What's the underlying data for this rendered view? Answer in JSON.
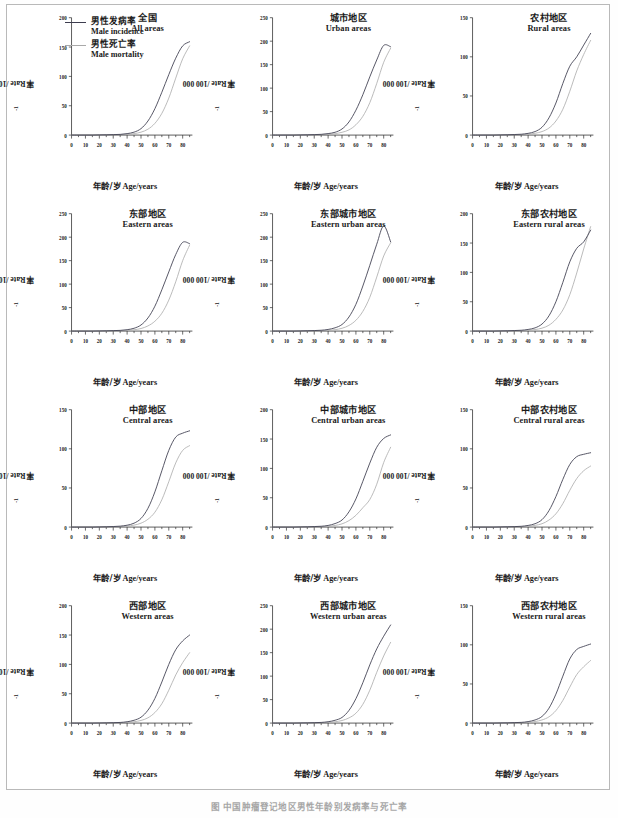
{
  "figure": {
    "axis_x_label_cn": "年龄/岁",
    "axis_x_label_en": "Age/years",
    "axis_y_label": "率Rate /100 000",
    "axis_y_label_sup": "-1",
    "caption": "图 中国肿瘤登记地区男性年龄别发病率与死亡率"
  },
  "legend": {
    "incidence": {
      "cn": "男性发病率",
      "en": "Male incidence",
      "color": "#3d3d4f"
    },
    "mortality": {
      "cn": "男性死亡率",
      "en": "Male mortality",
      "color": "#a9a9a9"
    }
  },
  "colors": {
    "incidence": "#3d3d4f",
    "mortality": "#a9a9a9",
    "axis": "#2b2b2b",
    "frame": "#b9b9b9"
  },
  "chart_data": [
    {
      "type": "line",
      "title_cn": "全国",
      "title_en": "All areas",
      "xlabel": "年龄/岁 Age/years",
      "ylabel": "率Rate /100 000-1",
      "xlim": [
        0,
        87
      ],
      "ylim": [
        0,
        200
      ],
      "xticks": [
        0,
        10,
        20,
        30,
        40,
        50,
        60,
        70,
        80
      ],
      "yticks": [
        0,
        50,
        100,
        150,
        200
      ],
      "grid": false,
      "x": [
        0,
        5,
        10,
        15,
        20,
        25,
        30,
        35,
        40,
        45,
        50,
        55,
        60,
        65,
        70,
        75,
        80,
        85
      ],
      "series": [
        {
          "name": "Male incidence",
          "values": [
            0,
            0,
            0,
            0,
            0.3,
            0.5,
            0.8,
            1.2,
            2.5,
            5,
            11,
            24,
            45,
            73,
            103,
            131,
            152,
            159
          ]
        },
        {
          "name": "Male mortality",
          "values": [
            0,
            0,
            0,
            0,
            0.2,
            0.3,
            0.4,
            0.7,
            1.3,
            2.5,
            5,
            10,
            20,
            37,
            63,
            97,
            130,
            152
          ]
        }
      ]
    },
    {
      "type": "line",
      "title_cn": "城市地区",
      "title_en": "Urban areas",
      "xlabel": "年龄/岁 Age/years",
      "ylabel": "率Rate /100 000-1",
      "xlim": [
        0,
        87
      ],
      "ylim": [
        0,
        250
      ],
      "xticks": [
        0,
        10,
        20,
        30,
        40,
        50,
        60,
        70,
        80
      ],
      "yticks": [
        0,
        50,
        100,
        150,
        200,
        250
      ],
      "grid": false,
      "x": [
        0,
        5,
        10,
        15,
        20,
        25,
        30,
        35,
        40,
        45,
        50,
        55,
        60,
        65,
        70,
        75,
        80,
        85
      ],
      "series": [
        {
          "name": "Male incidence",
          "values": [
            0,
            0,
            0,
            0,
            0.3,
            0.6,
            1.0,
            1.6,
            3.2,
            6,
            13,
            28,
            53,
            86,
            124,
            160,
            191,
            188
          ]
        },
        {
          "name": "Male mortality",
          "values": [
            0,
            0,
            0,
            0,
            0.2,
            0.3,
            0.5,
            0.8,
            1.5,
            3,
            6,
            11,
            22,
            40,
            69,
            110,
            155,
            185
          ]
        }
      ]
    },
    {
      "type": "line",
      "title_cn": "农村地区",
      "title_en": "Rural areas",
      "xlabel": "年龄/岁 Age/years",
      "ylabel": "率Rate /100 000-1",
      "xlim": [
        0,
        87
      ],
      "ylim": [
        0,
        150
      ],
      "xticks": [
        0,
        10,
        20,
        30,
        40,
        50,
        60,
        70,
        80
      ],
      "yticks": [
        0,
        50,
        100,
        150
      ],
      "grid": false,
      "x": [
        0,
        5,
        10,
        15,
        20,
        25,
        30,
        35,
        40,
        45,
        50,
        55,
        60,
        65,
        70,
        75,
        80,
        85
      ],
      "series": [
        {
          "name": "Male incidence",
          "values": [
            0,
            0,
            0,
            0,
            0.2,
            0.4,
            0.7,
            1.1,
            2.2,
            4.5,
            10,
            22,
            41,
            66,
            88,
            100,
            115,
            130
          ]
        },
        {
          "name": "Male mortality",
          "values": [
            0,
            0,
            0,
            0,
            0.2,
            0.3,
            0.4,
            0.6,
            1.2,
            2.3,
            4.5,
            9,
            18,
            33,
            56,
            82,
            103,
            121
          ]
        }
      ]
    },
    {
      "type": "line",
      "title_cn": "东部地区",
      "title_en": "Eastern areas",
      "xlabel": "年龄/岁 Age/years",
      "ylabel": "率Rate /100 000-1",
      "xlim": [
        0,
        87
      ],
      "ylim": [
        0,
        250
      ],
      "xticks": [
        0,
        10,
        20,
        30,
        40,
        50,
        60,
        70,
        80
      ],
      "yticks": [
        0,
        50,
        100,
        150,
        200,
        250
      ],
      "grid": false,
      "x": [
        0,
        5,
        10,
        15,
        20,
        25,
        30,
        35,
        40,
        45,
        50,
        55,
        60,
        65,
        70,
        75,
        80,
        85
      ],
      "series": [
        {
          "name": "Male incidence",
          "values": [
            0,
            0,
            0,
            0,
            0.3,
            0.6,
            1.0,
            1.5,
            3.0,
            6,
            13,
            28,
            53,
            88,
            126,
            163,
            189,
            186
          ]
        },
        {
          "name": "Male mortality",
          "values": [
            0,
            0,
            0,
            0,
            0.2,
            0.3,
            0.5,
            0.8,
            1.5,
            2.8,
            5.5,
            11,
            21,
            38,
            66,
            105,
            150,
            183
          ]
        }
      ]
    },
    {
      "type": "line",
      "title_cn": "东部城市地区",
      "title_en": "Eastern urban areas",
      "xlabel": "年龄/岁 Age/years",
      "ylabel": "率Rate /100 000-1",
      "xlim": [
        0,
        87
      ],
      "ylim": [
        0,
        250
      ],
      "xticks": [
        0,
        10,
        20,
        30,
        40,
        50,
        60,
        70,
        80
      ],
      "yticks": [
        0,
        50,
        100,
        150,
        200,
        250
      ],
      "grid": false,
      "x": [
        0,
        5,
        10,
        15,
        20,
        25,
        30,
        35,
        40,
        45,
        50,
        55,
        60,
        65,
        70,
        75,
        80,
        85
      ],
      "series": [
        {
          "name": "Male incidence",
          "values": [
            0,
            0,
            0,
            0,
            0.3,
            0.7,
            1.1,
            1.8,
            3.5,
            7,
            14,
            30,
            57,
            96,
            140,
            185,
            224,
            190
          ]
        },
        {
          "name": "Male mortality",
          "values": [
            0,
            0,
            0,
            0,
            0.2,
            0.3,
            0.5,
            0.9,
            1.6,
            3,
            6,
            12,
            23,
            42,
            72,
            115,
            160,
            188
          ]
        }
      ]
    },
    {
      "type": "line",
      "title_cn": "东部农村地区",
      "title_en": "Eastern rural areas",
      "xlabel": "年龄/岁 Age/years",
      "ylabel": "率Rate /100 000-1",
      "xlim": [
        0,
        87
      ],
      "ylim": [
        0,
        200
      ],
      "xticks": [
        0,
        10,
        20,
        30,
        40,
        50,
        60,
        70,
        80
      ],
      "yticks": [
        0,
        50,
        100,
        150,
        200
      ],
      "grid": false,
      "x": [
        0,
        5,
        10,
        15,
        20,
        25,
        30,
        35,
        40,
        45,
        50,
        55,
        60,
        65,
        70,
        75,
        80,
        85
      ],
      "series": [
        {
          "name": "Male incidence",
          "values": [
            0,
            0,
            0,
            0,
            0.3,
            0.5,
            0.9,
            1.4,
            2.8,
            5.5,
            12,
            26,
            50,
            83,
            118,
            141,
            152,
            172
          ]
        },
        {
          "name": "Male mortality",
          "values": [
            0,
            0,
            0,
            0,
            0.2,
            0.3,
            0.4,
            0.7,
            1.3,
            2.6,
            5,
            10,
            20,
            36,
            62,
            99,
            140,
            178
          ]
        }
      ]
    },
    {
      "type": "line",
      "title_cn": "中部地区",
      "title_en": "Central areas",
      "xlabel": "年龄/岁 Age/years",
      "ylabel": "率Rate /100 000-1",
      "xlim": [
        0,
        87
      ],
      "ylim": [
        0,
        150
      ],
      "xticks": [
        0,
        10,
        20,
        30,
        40,
        50,
        60,
        70,
        80
      ],
      "yticks": [
        0,
        50,
        100,
        150
      ],
      "grid": false,
      "x": [
        0,
        5,
        10,
        15,
        20,
        25,
        30,
        35,
        40,
        45,
        50,
        55,
        60,
        65,
        70,
        75,
        80,
        85
      ],
      "series": [
        {
          "name": "Male incidence",
          "values": [
            0,
            0,
            0,
            0,
            0.2,
            0.4,
            0.7,
            1.2,
            2.4,
            5,
            11,
            24,
            45,
            72,
            98,
            115,
            120,
            123
          ]
        },
        {
          "name": "Male mortality",
          "values": [
            0,
            0,
            0,
            0,
            0.2,
            0.3,
            0.4,
            0.7,
            1.3,
            2.5,
            5,
            10,
            19,
            35,
            58,
            82,
            98,
            104
          ]
        }
      ]
    },
    {
      "type": "line",
      "title_cn": "中部城市地区",
      "title_en": "Central urban areas",
      "xlabel": "年龄/岁 Age/years",
      "ylabel": "率Rate /100 000-1",
      "xlim": [
        0,
        87
      ],
      "ylim": [
        0,
        200
      ],
      "xticks": [
        0,
        10,
        20,
        30,
        40,
        50,
        60,
        70,
        80
      ],
      "yticks": [
        0,
        50,
        100,
        150,
        200
      ],
      "grid": false,
      "x": [
        0,
        5,
        10,
        15,
        20,
        25,
        30,
        35,
        40,
        45,
        50,
        55,
        60,
        65,
        70,
        75,
        80,
        85
      ],
      "series": [
        {
          "name": "Male incidence",
          "values": [
            0,
            0,
            0,
            0,
            0.3,
            0.5,
            0.9,
            1.4,
            2.8,
            6,
            12,
            26,
            48,
            78,
            109,
            136,
            151,
            157
          ]
        },
        {
          "name": "Male mortality",
          "values": [
            0,
            0,
            0,
            0,
            0.2,
            0.3,
            0.5,
            0.8,
            1.4,
            2.8,
            5.5,
            11,
            20,
            33,
            47,
            73,
            110,
            136
          ]
        }
      ]
    },
    {
      "type": "line",
      "title_cn": "中部农村地区",
      "title_en": "Central rural areas",
      "xlabel": "年龄/岁 Age/years",
      "ylabel": "率Rate /100 000-1",
      "xlim": [
        0,
        87
      ],
      "ylim": [
        0,
        150
      ],
      "xticks": [
        0,
        10,
        20,
        30,
        40,
        50,
        60,
        70,
        80
      ],
      "yticks": [
        0,
        50,
        100,
        150
      ],
      "grid": false,
      "x": [
        0,
        5,
        10,
        15,
        20,
        25,
        30,
        35,
        40,
        45,
        50,
        55,
        60,
        65,
        70,
        75,
        80,
        85
      ],
      "series": [
        {
          "name": "Male incidence",
          "values": [
            0,
            0,
            0,
            0,
            0.2,
            0.4,
            0.6,
            1.0,
            2.1,
            4.3,
            9.5,
            21,
            39,
            61,
            80,
            90,
            93,
            95
          ]
        },
        {
          "name": "Male mortality",
          "values": [
            0,
            0,
            0,
            0,
            0.2,
            0.3,
            0.4,
            0.6,
            1.1,
            2.2,
            4.3,
            9,
            17,
            30,
            47,
            62,
            72,
            78
          ]
        }
      ]
    },
    {
      "type": "line",
      "title_cn": "西部地区",
      "title_en": "Western areas",
      "xlabel": "年龄/岁 Age/years",
      "ylabel": "率Rate /100 000-1",
      "xlim": [
        0,
        87
      ],
      "ylim": [
        0,
        200
      ],
      "xticks": [
        0,
        10,
        20,
        30,
        40,
        50,
        60,
        70,
        80
      ],
      "yticks": [
        0,
        50,
        100,
        150,
        200
      ],
      "grid": false,
      "x": [
        0,
        5,
        10,
        15,
        20,
        25,
        30,
        35,
        40,
        45,
        50,
        55,
        60,
        65,
        70,
        75,
        80,
        85
      ],
      "series": [
        {
          "name": "Male incidence",
          "values": [
            0,
            0,
            0,
            0,
            0.2,
            0.4,
            0.7,
            1.1,
            2.3,
            4.8,
            10,
            22,
            42,
            70,
            100,
            125,
            140,
            150
          ]
        },
        {
          "name": "Male mortality",
          "values": [
            0,
            0,
            0,
            0,
            0.2,
            0.3,
            0.4,
            0.6,
            1.2,
            2.3,
            4.5,
            9,
            18,
            33,
            56,
            82,
            103,
            120
          ]
        }
      ]
    },
    {
      "type": "line",
      "title_cn": "西部城市地区",
      "title_en": "Western urban areas",
      "xlabel": "年龄/岁 Age/years",
      "ylabel": "率Rate /100 000-1",
      "xlim": [
        0,
        87
      ],
      "ylim": [
        0,
        250
      ],
      "xticks": [
        0,
        10,
        20,
        30,
        40,
        50,
        60,
        70,
        80
      ],
      "yticks": [
        0,
        50,
        100,
        150,
        200,
        250
      ],
      "grid": false,
      "x": [
        0,
        5,
        10,
        15,
        20,
        25,
        30,
        35,
        40,
        45,
        50,
        55,
        60,
        65,
        70,
        75,
        80,
        85
      ],
      "series": [
        {
          "name": "Male incidence",
          "values": [
            0,
            0,
            0,
            0,
            0.3,
            0.5,
            0.9,
            1.4,
            2.9,
            6,
            12,
            27,
            52,
            86,
            124,
            158,
            185,
            209
          ]
        },
        {
          "name": "Male mortality",
          "values": [
            0,
            0,
            0,
            0,
            0.2,
            0.3,
            0.5,
            0.7,
            1.4,
            2.8,
            5.5,
            11,
            21,
            40,
            70,
            108,
            143,
            172
          ]
        }
      ]
    },
    {
      "type": "line",
      "title_cn": "西部农村地区",
      "title_en": "Western rural areas",
      "xlabel": "年龄/岁 Age/years",
      "ylabel": "率Rate /100 000-1",
      "xlim": [
        0,
        87
      ],
      "ylim": [
        0,
        150
      ],
      "xticks": [
        0,
        10,
        20,
        30,
        40,
        50,
        60,
        70,
        80
      ],
      "yticks": [
        0,
        50,
        100,
        150
      ],
      "grid": false,
      "x": [
        0,
        5,
        10,
        15,
        20,
        25,
        30,
        35,
        40,
        45,
        50,
        55,
        60,
        65,
        70,
        75,
        80,
        85
      ],
      "series": [
        {
          "name": "Male incidence",
          "values": [
            0,
            0,
            0,
            0,
            0.2,
            0.3,
            0.6,
            0.9,
            1.9,
            4,
            8.5,
            19,
            37,
            60,
            82,
            94,
            98,
            101
          ]
        },
        {
          "name": "Male mortality",
          "values": [
            0,
            0,
            0,
            0,
            0.2,
            0.2,
            0.3,
            0.5,
            1.0,
            2.0,
            4,
            8,
            16,
            29,
            46,
            62,
            72,
            80
          ]
        }
      ]
    }
  ]
}
